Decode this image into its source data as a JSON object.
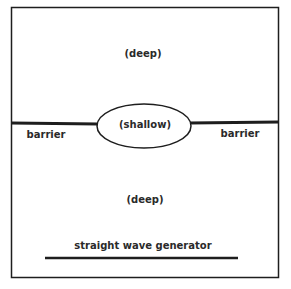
{
  "diagram": {
    "regions": {
      "top": "(deep)",
      "center": "(shallow)",
      "bottom": "(deep)"
    },
    "barrier_left": "barrier",
    "barrier_right": "barrier",
    "generator": "straight wave generator"
  },
  "colors": {
    "line": "#1e1e1e",
    "text": "#2a2a2a",
    "background": "#ffffff"
  }
}
